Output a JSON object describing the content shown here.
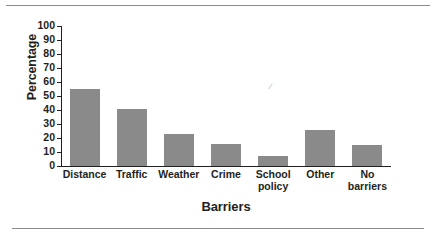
{
  "figure": {
    "background": "#ffffff",
    "bar_color": "#8a8a8a",
    "axis_color": "#231f20",
    "rule_color": "#8c8c8c"
  },
  "chart_data": {
    "type": "bar",
    "title": "",
    "xlabel": "Barriers",
    "ylabel": "Percentage",
    "categories": [
      "Distance",
      "Traffic",
      "Weather",
      "Crime",
      "School policy",
      "Other",
      "No barriers"
    ],
    "values": [
      55,
      41,
      23,
      16,
      7,
      26,
      15
    ],
    "ylim": [
      0,
      100
    ],
    "ytick_labels": [
      "100",
      "90",
      "80",
      "70",
      "60",
      "50",
      "40",
      "30",
      "20",
      "10",
      "0"
    ],
    "ytick_values": [
      100,
      90,
      80,
      70,
      60,
      50,
      40,
      30,
      20,
      10,
      0
    ],
    "grid": false,
    "legend": null,
    "series": [
      {
        "name": "Percentage",
        "values": [
          55,
          41,
          23,
          16,
          7,
          26,
          15
        ]
      }
    ]
  },
  "artifacts": {
    "speck": "⁄"
  }
}
